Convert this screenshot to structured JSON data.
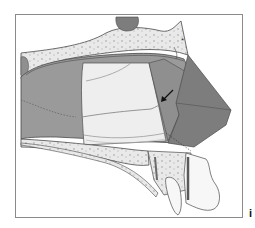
{
  "figure": {
    "panel_label": "i",
    "annotation_marker": "*",
    "colors": {
      "background": "#ffffff",
      "frame": "#8a8a8a",
      "cavity": "#9a9a9a",
      "bone": "#e9e9e9",
      "bone_speckle": "#b8b8b8",
      "graft": "#eeeeee",
      "flap_dark": "#7d7d7d",
      "flap_mid": "#8f8f8f",
      "tooth": "#f7f7f7",
      "outline": "#4a4a4a"
    }
  }
}
